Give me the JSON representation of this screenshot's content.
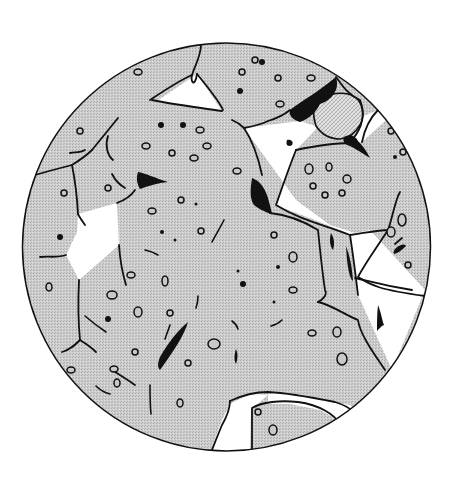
{
  "figure": {
    "width": 459,
    "height": 481,
    "field": {
      "cx": 226.5,
      "cy": 247,
      "r": 204
    },
    "colors": {
      "background": "#ffffff",
      "grain": "#c9c9c9",
      "grain_dot": "#b4b4b4",
      "special_phase": "#dcdcdc",
      "void": "#ffffff",
      "dark_phase": "#111111",
      "line": "#111111"
    },
    "voids": [
      "M157,101 C165,93 185,78 197,74 C205,88 214,103 222,111 C200,107 175,104 157,101 Z",
      "M78,214 C95,212 108,207 117,203 C118,220 116,235 119,245 C108,258 92,272 79,280 C75,268 72,260 66,255 C72,246 78,240 77,232 C78,226 80,220 78,214 Z",
      "M244,128 C265,122 290,120 305,118 C322,119 340,140 350,143 C330,145 310,144 296,150 C285,175 280,195 275,205 C300,218 330,225 350,235 C355,262 355,280 358,295 C375,320 385,340 392,370 C400,350 415,320 425,290 C415,280 392,265 370,230 C362,230 350,230 345,232 C335,225 320,222 310,218 C305,210 300,205 296,200 C280,180 265,160 244,128 Z",
      "M351,142 C360,135 370,125 380,115 C390,110 405,105 418,115 C420,140 416,162 410,176 C398,165 383,150 370,148 C362,146 356,144 351,142 Z",
      "M318,301 C340,306 360,320 382,372 C373,390 365,400 355,402 C320,397 290,391 268,398 C245,402 230,420 212,455 L250,455 C253,430 258,405 272,400 C300,395 330,398 355,402 Z",
      "M250,407 C290,393 320,397 340,410 C333,435 315,447 290,450 C275,452 262,452 252,452 C250,438 249,422 250,407 Z"
    ],
    "voids_simple": [
      {
        "d": "M157,101 L197,74 L222,111 Z"
      },
      {
        "d": "M78,214 L117,203 L119,245 L79,280 L66,255 L77,232 Z"
      },
      {
        "d": "M244,128 L300,121 L318,127 L296,150 L275,205 L310,218 L345,232 L350,235 L358,295 L392,370 L425,290 L370,230 L355,233 L330,225 L296,200 Z"
      },
      {
        "d": "M361,117 L378,110 L395,112 L362,142 L352,142 Z"
      },
      {
        "d": "M209,455 L222,420 L230,404 L250,394 L268,395 L262,400 L251,410 L250,452 Z"
      },
      {
        "d": "M268,394 L300,394 L318,400 L350,405 L360,412 L338,420 L320,410 L290,404 L268,404 Z"
      },
      {
        "d": "M405,117 L420,130 L415,112 Z"
      }
    ],
    "special_grain": "M318,100 C328,93 345,91 353,96 C362,100 366,115 360,125 C356,132 350,138 340,139 C330,139 322,135 316,126 C313,116 312,106 318,100 Z",
    "dark_phases": [
      "M290,110 C303,100 318,92 336,77 C340,90 332,100 320,104 C316,112 310,118 300,122 C294,120 288,116 290,110 Z",
      "M344,137 C350,134 356,136 358,141 C362,145 366,150 370,158 C362,153 356,149 350,146 C345,145 342,141 344,137 Z",
      "M252,178 C258,180 264,185 268,198 C270,206 272,212 272,214 C264,212 258,208 254,205 C250,200 250,190 252,178 Z",
      "M138,172 C145,173 155,178 168,182 C158,183 148,186 140,189 C137,184 136,178 138,172 Z",
      "M160,357 C168,343 178,330 188,322 C185,333 176,348 160,370 C157,367 158,362 160,357 Z",
      "M331,233 C334,238 335,243 333,250 C330,246 329,240 331,233 Z",
      "M346,246 C349,254 352,265 353,281 C349,278 347,265 346,246 Z",
      "M378,305 C381,312 382,320 384,325 C381,326 379,329 377,331 C377,322 377,314 378,305 Z",
      "M396,248 C400,245 404,243 406,246 C402,250 398,253 394,254 C393,252 394,250 396,248 Z",
      "M236,349 C238,353 238,358 236,364 C234,361 234,355 236,349 Z",
      "M287,140 C291,139 294,142 292,145 C289,147 285,146 287,140 Z"
    ],
    "boundaries": [
      "M201,46 C200,58 195,65 192,75 C190,82 195,88 197,74",
      "M192,75 C180,80 165,90 150,100",
      "M197,74 C210,90 220,102 223,110",
      "M152,100 C170,104 195,107 222,111",
      "M244,128 C255,126 262,124 268,121 C278,118 285,114 290,110",
      "M336,77 C342,85 348,95 360,100 C366,115 362,128 352,140",
      "M378,110 C368,120 364,132 362,142",
      "M415,112 C398,115 385,113 378,110",
      "M296,150 C320,145 340,143 350,143",
      "M296,150 C288,170 282,188 276,205 C300,220 325,225 350,235",
      "M350,235 C370,232 380,230 388,230 C392,220 395,200 400,192",
      "M388,230 C375,250 366,262 358,277 C370,285 380,290 425,296",
      "M244,128 C252,140 258,156 262,175",
      "M244,128 C240,124 237,122 232,120",
      "M270,213 C290,215 305,222 318,230 C320,250 322,270 325,290 C328,295 322,300 318,302",
      "M318,302 C332,305 345,315 358,320 C360,335 375,355 385,370",
      "M230,401 C230,408 226,418 222,425 C217,437 214,445 210,455",
      "M230,401 C245,394 260,392 268,392 C290,393 310,397 335,402 C345,405 352,410 355,413",
      "M252,452 C252,435 252,420 252,408 C262,402 280,400 298,402 C320,405 335,415 340,424",
      "M28,177 C45,172 60,168 72,165 C80,160 87,155 92,150",
      "M92,150 C100,140 110,128 118,118",
      "M108,136 C105,145 107,155 113,160",
      "M72,165 C75,180 77,195 78,214",
      "M78,214 C80,218 83,222 85,225",
      "M117,203 C125,200 131,196 135,190",
      "M119,245 C120,260 123,275 126,285",
      "M66,255 C58,258 48,256 40,257",
      "M79,280 C78,300 78,320 80,340",
      "M80,340 C75,345 70,350 62,352",
      "M80,340 C88,345 92,348 96,352",
      "M112,370 C120,375 128,380 135,385",
      "M112,174 C115,180 120,185 125,188",
      "M85,150 C80,153 75,152 70,153",
      "M395,244 L402,238",
      "M355,278 C365,280 380,285 412,290",
      "M350,235 C353,254 355,270 358,295"
    ],
    "cracks": [
      "M224,220 C220,228 215,236 212,242",
      "M145,250 C150,251 155,253 158,255",
      "M198,296 C198,300 197,305 196,308",
      "M232,321 C235,323 237,326 238,329",
      "M271,326 C275,325 279,323 282,320",
      "M85,316 C92,322 100,328 106,332",
      "M150,385 C150,395 150,405 151,414",
      "M165,339 C167,333 169,328 170,325",
      "M96,386 C100,390 106,393 110,394",
      "M60,370 C62,374 63,378 62,382"
    ],
    "rings": [
      [
        138,
        72,
        4,
        3
      ],
      [
        255,
        60,
        3,
        3
      ],
      [
        242,
        72,
        3,
        3
      ],
      [
        278,
        78,
        3,
        3
      ],
      [
        311,
        78,
        4,
        3
      ],
      [
        280,
        104,
        4,
        3
      ],
      [
        200,
        130,
        4,
        3
      ],
      [
        207,
        146,
        4,
        3
      ],
      [
        146,
        146,
        4,
        3
      ],
      [
        172,
        153,
        3,
        3
      ],
      [
        194,
        158,
        4,
        3
      ],
      [
        80,
        131,
        3,
        3
      ],
      [
        237,
        171,
        4,
        3
      ],
      [
        108,
        188,
        3,
        3
      ],
      [
        181,
        200,
        3,
        3
      ],
      [
        152,
        211,
        4,
        3
      ],
      [
        201,
        231,
        3,
        3
      ],
      [
        274,
        235,
        3,
        3
      ],
      [
        309,
        169,
        4,
        5
      ],
      [
        329,
        167,
        3,
        4
      ],
      [
        313,
        186,
        3,
        3
      ],
      [
        325,
        195,
        3,
        3
      ],
      [
        342,
        193,
        3,
        3
      ],
      [
        347,
        179,
        4,
        4
      ],
      [
        402,
        220,
        4,
        6
      ],
      [
        391,
        232,
        4,
        5
      ],
      [
        408,
        265,
        3,
        3
      ],
      [
        391,
        131,
        3,
        3
      ],
      [
        403,
        152,
        3,
        3
      ],
      [
        131,
        275,
        4,
        3
      ],
      [
        293,
        257,
        4,
        5
      ],
      [
        293,
        290,
        4,
        3
      ],
      [
        112,
        295,
        5,
        4
      ],
      [
        165,
        281,
        3,
        5
      ],
      [
        138,
        312,
        4,
        5
      ],
      [
        170,
        313,
        3,
        3
      ],
      [
        135,
        352,
        3,
        3
      ],
      [
        114,
        369,
        4,
        3
      ],
      [
        214,
        344,
        6,
        5
      ],
      [
        188,
        363,
        3,
        3
      ],
      [
        180,
        403,
        3,
        4
      ],
      [
        117,
        383,
        3,
        4
      ],
      [
        312,
        333,
        4,
        3
      ],
      [
        337,
        332,
        4,
        5
      ],
      [
        342,
        359,
        5,
        6
      ],
      [
        258,
        412,
        3,
        3
      ],
      [
        273,
        430,
        4,
        5
      ],
      [
        49,
        287,
        3,
        4
      ],
      [
        119,
        433,
        4,
        3
      ],
      [
        71,
        370,
        4,
        3
      ],
      [
        64,
        193,
        3,
        3
      ]
    ],
    "dots": [
      [
        161,
        125,
        3
      ],
      [
        183,
        125,
        3
      ],
      [
        240,
        91,
        3
      ],
      [
        262,
        62,
        3
      ],
      [
        60,
        237,
        3
      ],
      [
        108,
        319,
        3
      ],
      [
        243,
        284,
        3
      ],
      [
        162,
        232,
        2
      ],
      [
        175,
        240,
        1.5
      ],
      [
        196,
        204,
        1.5
      ],
      [
        238,
        271,
        1.5
      ],
      [
        274,
        302,
        1.5
      ],
      [
        278,
        267,
        2
      ],
      [
        395,
        157,
        2
      ]
    ]
  }
}
